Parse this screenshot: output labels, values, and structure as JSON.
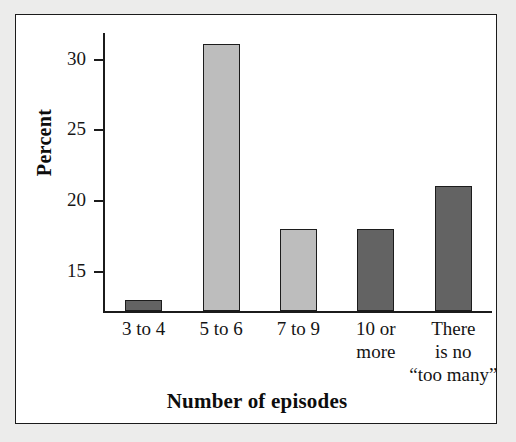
{
  "chart_data": {
    "type": "bar",
    "title": "",
    "xlabel": "Number of episodes",
    "ylabel": "Percent",
    "categories": [
      "3 to 4",
      "5 to 6",
      "7 to 9",
      "10 or\nmore",
      "There\nis no\n“too many”"
    ],
    "values": [
      13,
      31,
      18,
      18,
      21
    ],
    "bar_colors": [
      "#636363",
      "#bdbdbd",
      "#bdbdbd",
      "#636363",
      "#636363"
    ],
    "bar_border_color": "#1c1c1c",
    "ylim": [
      12.2,
      31.8
    ],
    "yticks": [
      15,
      20,
      25,
      30
    ],
    "ytick_labels": [
      "15",
      "20",
      "25",
      "30"
    ],
    "grid": false,
    "legend": "none",
    "axis_color": "#1b1b1b",
    "background": "#ffffff",
    "page_background": "#ececeb"
  },
  "axis": {
    "y_title": "Percent",
    "x_title": "Number of episodes"
  }
}
